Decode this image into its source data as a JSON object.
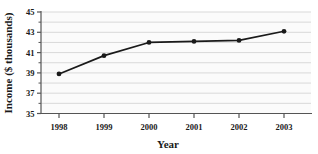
{
  "chart_data": {
    "type": "line",
    "title": "",
    "xlabel": "Year",
    "ylabel": "Income ($ thousands)",
    "categories": [
      "1998",
      "1999",
      "2000",
      "2001",
      "2002",
      "2003"
    ],
    "x": [
      1998,
      1999,
      2000,
      2001,
      2002,
      2003
    ],
    "values": [
      38.9,
      40.7,
      42.0,
      42.1,
      42.2,
      43.1
    ],
    "series": [
      {
        "name": "Income",
        "values": [
          38.9,
          40.7,
          42.0,
          42.1,
          42.2,
          43.1
        ]
      }
    ],
    "ylim": [
      35,
      45
    ],
    "xlim": [
      1997.6,
      2003.6
    ],
    "y_tick_labels": [
      "35",
      "37",
      "39",
      "41",
      "43",
      "45"
    ],
    "y_tick_values": [
      35,
      37,
      39,
      41,
      43,
      45
    ],
    "y_minor_values": [
      36,
      38,
      40,
      42,
      44
    ],
    "x_tick_labels": [
      "1998",
      "1999",
      "2000",
      "2001",
      "2002",
      "2003"
    ],
    "grid": true,
    "grid_orientation": "horizontal",
    "legend": false,
    "legend_position": "none",
    "marker": "filled-circle",
    "line_color": "#1a1a1a",
    "marker_color": "#1a1a1a",
    "grid_color": "#d9d9d9",
    "axis_color": "#555555",
    "plot_background": "#fbfbfb"
  },
  "axes": {
    "y_title": "Income ($ thousands)",
    "x_title": "Year"
  }
}
